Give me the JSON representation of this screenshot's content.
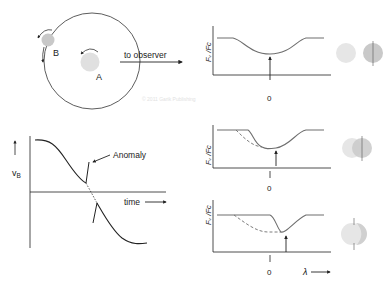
{
  "orbit_panel": {
    "star_b_label": "B",
    "star_a_label": "A",
    "observer_label": "to observer"
  },
  "velocity_panel": {
    "y_axis_label": "v",
    "y_axis_subscript": "B",
    "x_axis_label": "time",
    "annotation": "Anomaly"
  },
  "profile_panels": [
    {
      "y_axis_label": "Fᵥ /Fᴄ",
      "zero_tick": "0"
    },
    {
      "y_axis_label": "Fᵥ /Fᴄ",
      "zero_tick": "0"
    },
    {
      "y_axis_label": "Fᵥ /Fᴄ",
      "zero_tick": "0",
      "x_axis_label": "λ"
    }
  ],
  "watermark": "© 2011 Garik Publishing",
  "colors": {
    "line": "#6e6e6e",
    "axis": "#222222",
    "star_a": "#e0e0e0",
    "star_b": "#c8c8c8",
    "disk_light": "#e6e6e6",
    "disk_dark": "#c9c9c9"
  }
}
